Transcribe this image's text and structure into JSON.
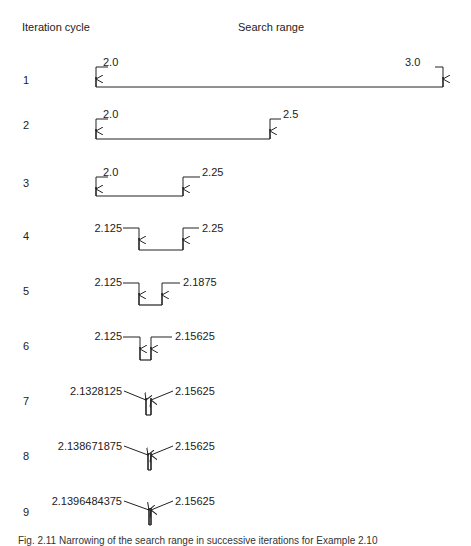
{
  "figure": {
    "header_left": "Iteration cycle",
    "header_right": "Search range",
    "caption": "Fig. 2.11 Narrowing of the search range in successive iterations for Example 2.10"
  },
  "chart_data": {
    "type": "table",
    "title": "Narrowing of the search range",
    "columns": [
      "Iteration cycle",
      "Search range lower",
      "Search range upper"
    ],
    "rows": [
      {
        "cycle": "1",
        "lower": "2.0",
        "upper": "3.0"
      },
      {
        "cycle": "2",
        "lower": "2.0",
        "upper": "2.5"
      },
      {
        "cycle": "3",
        "lower": "2.0",
        "upper": "2.25"
      },
      {
        "cycle": "4",
        "lower": "2.125",
        "upper": "2.25"
      },
      {
        "cycle": "5",
        "lower": "2.125",
        "upper": "2.1875"
      },
      {
        "cycle": "6",
        "lower": "2.125",
        "upper": "2.15625"
      },
      {
        "cycle": "7",
        "lower": "2.1328125",
        "upper": "2.15625"
      },
      {
        "cycle": "8",
        "lower": "2.138671875",
        "upper": "2.15625"
      },
      {
        "cycle": "9",
        "lower": "2.1396484375",
        "upper": "2.15625"
      }
    ]
  },
  "layout_rows": [
    {
      "label_y": 74,
      "xl": 96,
      "xr": 443,
      "top": 67,
      "bottom": 87,
      "style": "outer",
      "lt_x": 103,
      "lt_y": 66,
      "rt_x": 405,
      "rt_y": 66
    },
    {
      "label_y": 119,
      "xl": 96,
      "xr": 270,
      "top": 119,
      "bottom": 139,
      "style": "outer",
      "lt_x": 103,
      "lt_y": 118,
      "rt_x": 283,
      "rt_y": 118
    },
    {
      "label_y": 177,
      "xl": 96,
      "xr": 183,
      "top": 177,
      "bottom": 196,
      "style": "outer-inner",
      "lt_x": 103,
      "lt_y": 176,
      "rt_x": 202,
      "rt_y": 176
    },
    {
      "label_y": 230,
      "xl": 139,
      "xr": 183,
      "top": 228,
      "bottom": 250,
      "style": "inner",
      "lt_x": 122,
      "lt_y": 232,
      "rt_x": 202,
      "rt_y": 232
    },
    {
      "label_y": 285,
      "xl": 139,
      "xr": 162,
      "top": 283,
      "bottom": 305,
      "style": "inner",
      "lt_x": 122,
      "lt_y": 286,
      "rt_x": 183,
      "rt_y": 286
    },
    {
      "label_y": 340,
      "xl": 140,
      "xr": 151,
      "top": 337,
      "bottom": 360,
      "style": "inner",
      "lt_x": 122,
      "lt_y": 340,
      "rt_x": 175,
      "rt_y": 340
    },
    {
      "label_y": 395,
      "xl": 146,
      "xr": 151,
      "top": 388,
      "bottom": 415,
      "style": "diag",
      "lt_x": 122,
      "lt_y": 395,
      "rt_x": 175,
      "rt_y": 395
    },
    {
      "label_y": 450,
      "xl": 148,
      "xr": 151,
      "top": 443,
      "bottom": 470,
      "style": "diag",
      "lt_x": 122,
      "lt_y": 450,
      "rt_x": 175,
      "rt_y": 450
    },
    {
      "label_y": 506,
      "xl": 149,
      "xr": 151,
      "top": 498,
      "bottom": 525,
      "style": "diag",
      "lt_x": 122,
      "lt_y": 505,
      "rt_x": 175,
      "rt_y": 505
    }
  ]
}
